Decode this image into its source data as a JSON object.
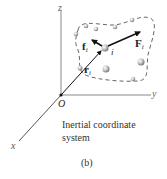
{
  "figure": {
    "axes": {
      "z_label": "z",
      "y_label": "y",
      "x_label": "x",
      "origin_label": "O"
    },
    "vectors": {
      "external_force": {
        "symbol": "F",
        "subscript": "i"
      },
      "internal_force": {
        "symbol": "f",
        "subscript": "i"
      },
      "position": {
        "symbol": "r",
        "subscript": "i"
      }
    },
    "particle_label": "i",
    "caption_line1": "Inertial coordinate",
    "caption_line2": "system",
    "subfigure_label": "(b)",
    "colors": {
      "axis": "#8a8a8a",
      "vector": "#111111",
      "boundary": "#555555",
      "particle": "#b8b8b8"
    }
  }
}
